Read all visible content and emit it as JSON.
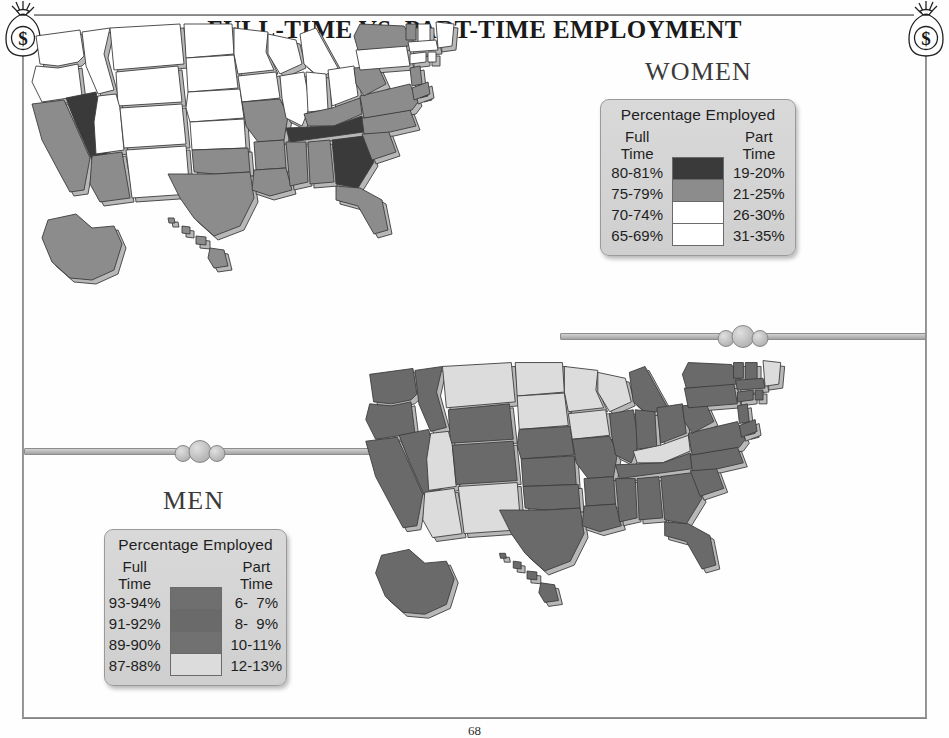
{
  "page": {
    "title": "FULL-TIME VS. PART-TIME EMPLOYMENT",
    "page_number": "68",
    "corner_ornament_icon": "money-bag-icon",
    "divider_ornament_icon": "bead-divider-icon"
  },
  "sections": {
    "women": {
      "heading": "WOMEN",
      "legend": {
        "title": "Percentage Employed",
        "col_left_head_line1": "Full",
        "col_left_head_line2": "Time",
        "col_right_head_line1": "Part",
        "col_right_head_line2": "Time",
        "rows": [
          {
            "full_time": "80-81%",
            "part_time": "19-20%",
            "color": "#3a3a3a"
          },
          {
            "full_time": "75-79%",
            "part_time": "21-25%",
            "color": "#8c8c8c"
          },
          {
            "full_time": "70-74%",
            "part_time": "26-30%",
            "color": "#ffffff"
          },
          {
            "full_time": "65-69%",
            "part_time": "31-35%",
            "color": "#ffffff"
          }
        ]
      }
    },
    "men": {
      "heading": "MEN",
      "legend": {
        "title": "Percentage Employed",
        "col_left_head_line1": "Full",
        "col_left_head_line2": "Time",
        "col_right_head_line1": "Part",
        "col_right_head_line2": "Time",
        "rows": [
          {
            "full_time": "93-94%",
            "part_time": " 6-  7%",
            "color": "#6f6f6f"
          },
          {
            "full_time": "91-92%",
            "part_time": " 8-  9%",
            "color": "#6a6a6a"
          },
          {
            "full_time": "89-90%",
            "part_time": "10-11%",
            "color": "#717171"
          },
          {
            "full_time": "87-88%",
            "part_time": "12-13%",
            "color": "#dcdcdc"
          }
        ]
      }
    }
  },
  "chart_data": [
    {
      "type": "map",
      "title": "WOMEN",
      "subtitle": "Percentage Employed",
      "legend_position": "top-right",
      "palette": [
        "#3a3a3a",
        "#8c8c8c",
        "#ffffff",
        "#ffffff"
      ],
      "bins_full_time": [
        "80-81%",
        "75-79%",
        "70-74%",
        "65-69%"
      ],
      "bins_part_time": [
        "19-20%",
        "21-25%",
        "26-30%",
        "31-35%"
      ],
      "states": {
        "AL": 1,
        "AK": 1,
        "AZ": 1,
        "AR": 1,
        "CA": 1,
        "CO": 2,
        "CT": 2,
        "DE": 0,
        "FL": 1,
        "GA": 0,
        "HI": 1,
        "ID": 2,
        "IL": 2,
        "IN": 2,
        "IA": 2,
        "KS": 2,
        "KY": 1,
        "LA": 1,
        "ME": 2,
        "MD": 1,
        "MA": 2,
        "MI": 2,
        "MN": 2,
        "MS": 1,
        "MO": 1,
        "MT": 2,
        "NE": 2,
        "NV": 0,
        "NH": 2,
        "NJ": 1,
        "NM": 2,
        "NY": 1,
        "NC": 1,
        "ND": 2,
        "OH": 2,
        "OK": 1,
        "OR": 2,
        "PA": 2,
        "RI": 2,
        "SC": 1,
        "SD": 2,
        "TN": 0,
        "TX": 1,
        "UT": 2,
        "VT": 1,
        "VA": 1,
        "WA": 2,
        "WV": 1,
        "WI": 2,
        "WY": 2
      }
    },
    {
      "type": "map",
      "title": "MEN",
      "subtitle": "Percentage Employed",
      "legend_position": "bottom-left",
      "palette": [
        "#6f6f6f",
        "#6a6a6a",
        "#717171",
        "#dcdcdc"
      ],
      "bins_full_time": [
        "93-94%",
        "91-92%",
        "89-90%",
        "87-88%"
      ],
      "bins_part_time": [
        " 6- 7%",
        " 8- 9%",
        "10-11%",
        "12-13%"
      ],
      "states": {
        "AL": 1,
        "AK": 1,
        "AZ": 3,
        "AR": 1,
        "CA": 1,
        "CO": 1,
        "CT": 1,
        "DE": 1,
        "FL": 1,
        "GA": 1,
        "HI": 1,
        "ID": 1,
        "IL": 1,
        "IN": 1,
        "IA": 3,
        "KS": 1,
        "KY": 3,
        "LA": 1,
        "ME": 3,
        "MD": 1,
        "MA": 1,
        "MI": 1,
        "MN": 3,
        "MS": 1,
        "MO": 1,
        "MT": 3,
        "NE": 1,
        "NV": 1,
        "NH": 1,
        "NJ": 1,
        "NM": 3,
        "NY": 1,
        "NC": 1,
        "ND": 3,
        "OH": 1,
        "OK": 1,
        "OR": 1,
        "PA": 1,
        "RI": 1,
        "SC": 1,
        "SD": 3,
        "TN": 1,
        "TX": 1,
        "UT": 3,
        "VT": 1,
        "VA": 1,
        "WA": 1,
        "WV": 1,
        "WI": 3,
        "WY": 1
      }
    }
  ]
}
